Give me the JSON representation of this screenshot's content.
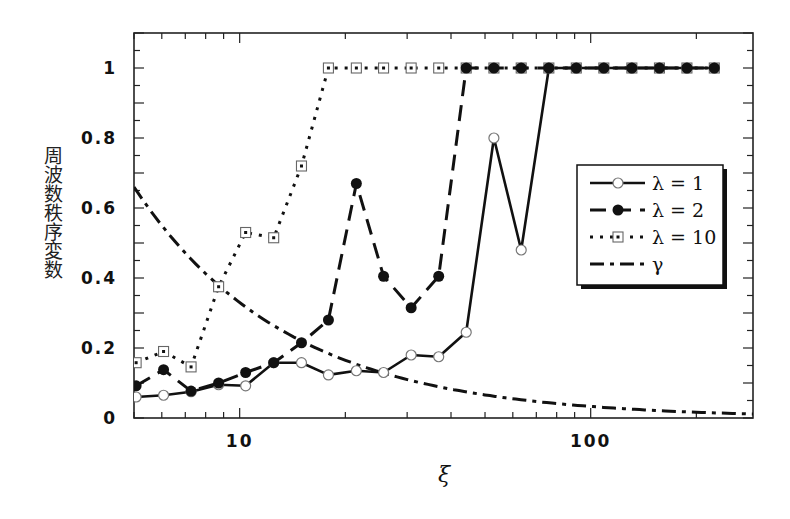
{
  "chart_data": {
    "type": "line",
    "title": "",
    "xlabel": "ξ",
    "ylabel": "周波数秩序変数",
    "xscale": "log",
    "xlim": [
      5,
      290
    ],
    "ylim": [
      0,
      1.1
    ],
    "xticks": [
      10,
      100
    ],
    "xtick_labels": [
      "10",
      "100"
    ],
    "yticks": [
      0,
      0.2,
      0.4,
      0.6,
      0.8,
      1
    ],
    "ytick_labels": [
      "0",
      "0.2",
      "0.4",
      "0.6",
      "0.8",
      "1"
    ],
    "grid": false,
    "legend_position": "center-right",
    "x": [
      5.07,
      6.07,
      7.27,
      8.71,
      10.4,
      12.5,
      15.0,
      17.9,
      21.5,
      25.7,
      30.8,
      36.9,
      44.2,
      53.0,
      63.4,
      76.0,
      91.0,
      109,
      131,
      157,
      188,
      225
    ],
    "series": [
      {
        "name": "λ = 1",
        "style": "solid",
        "marker": "open-circle",
        "values": [
          0.06,
          0.065,
          0.075,
          0.095,
          0.092,
          0.158,
          0.158,
          0.123,
          0.135,
          0.13,
          0.18,
          0.175,
          0.245,
          0.8,
          0.48,
          1,
          1,
          1,
          1,
          1,
          1,
          1
        ]
      },
      {
        "name": "λ = 2",
        "style": "dashed",
        "marker": "filled-circle",
        "values": [
          0.092,
          0.138,
          0.077,
          0.1,
          0.13,
          0.158,
          0.215,
          0.28,
          0.67,
          0.405,
          0.315,
          0.405,
          1,
          1,
          1,
          1,
          1,
          1,
          1,
          1,
          1,
          1
        ]
      },
      {
        "name": "λ = 10",
        "style": "dotted",
        "marker": "dotted-square",
        "values": [
          0.158,
          0.19,
          0.146,
          0.375,
          0.53,
          0.515,
          0.72,
          1,
          1,
          1,
          1,
          1,
          1,
          1,
          1,
          1,
          1,
          1,
          1,
          1,
          1,
          1
        ]
      },
      {
        "name": "γ",
        "style": "dash-dot",
        "marker": "none",
        "function": "3.3/ξ",
        "x": [
          5,
          6,
          7,
          8,
          10,
          12,
          15,
          20,
          25,
          30,
          40,
          50,
          60,
          80,
          100,
          130,
          160,
          200,
          250,
          290
        ],
        "values": [
          0.66,
          0.55,
          0.471,
          0.4125,
          0.33,
          0.275,
          0.22,
          0.165,
          0.132,
          0.11,
          0.0825,
          0.066,
          0.055,
          0.041,
          0.033,
          0.025,
          0.021,
          0.0165,
          0.0132,
          0.0114
        ]
      }
    ]
  }
}
